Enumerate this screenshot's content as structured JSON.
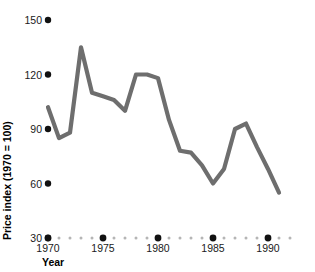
{
  "chart_data": {
    "type": "line",
    "title": "",
    "xlabel": "Year",
    "ylabel": "Price index (1970 = 100)",
    "x": [
      1970,
      1971,
      1972,
      1973,
      1974,
      1975,
      1976,
      1977,
      1978,
      1979,
      1980,
      1981,
      1982,
      1983,
      1984,
      1985,
      1986,
      1987,
      1988,
      1989,
      1990,
      1991
    ],
    "values": [
      102,
      85,
      88,
      135,
      110,
      108,
      106,
      100,
      120,
      120,
      118,
      95,
      78,
      77,
      70,
      60,
      68,
      90,
      93,
      80,
      68,
      55
    ],
    "xlim": [
      1970,
      1991
    ],
    "ylim": [
      30,
      150
    ],
    "x_tick_labels": [
      "1970",
      "1975",
      "1980",
      "1985",
      "1990"
    ],
    "x_tick_values": [
      1970,
      1975,
      1980,
      1985,
      1990
    ],
    "y_tick_labels": [
      "30",
      "60",
      "90",
      "120",
      "150"
    ],
    "y_tick_values": [
      30,
      60,
      90,
      120,
      150
    ],
    "grid": false,
    "legend": "none",
    "line_color": "#6e6e6e",
    "axis_dot_color": "#111111",
    "minor_dot_color": "#b5b5b5",
    "background_color": "#ffffff"
  },
  "axis": {
    "y_title": "Price index (1970 = 100)",
    "x_title": "Year"
  }
}
